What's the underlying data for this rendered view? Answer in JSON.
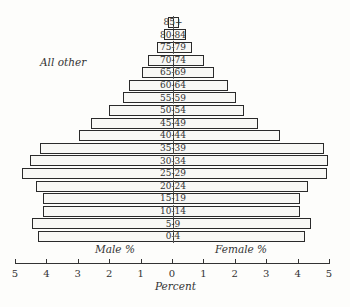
{
  "chart_data": {
    "type": "bar",
    "subtype": "population-pyramid",
    "title": "",
    "annotation": "All other",
    "xlabel": "Percent",
    "left_label": "Male %",
    "right_label": "Female %",
    "xlim": [
      -5,
      5
    ],
    "x_ticks": [
      "5",
      "4",
      "3",
      "2",
      "1",
      "0",
      "1",
      "2",
      "3",
      "4",
      "5"
    ],
    "grid": false,
    "categories": [
      "85+",
      "80-84",
      "75-79",
      "70-74",
      "65-69",
      "60-64",
      "55-59",
      "50-54",
      "45-49",
      "40-44",
      "35-39",
      "30-34",
      "25-29",
      "20-24",
      "15-19",
      "10-14",
      "5-9",
      "0-4"
    ],
    "series": [
      {
        "name": "Male %",
        "values": [
          0.15,
          0.3,
          0.5,
          0.8,
          1.0,
          1.4,
          1.6,
          2.05,
          2.6,
          3.0,
          4.25,
          4.55,
          4.8,
          4.35,
          4.15,
          4.15,
          4.5,
          4.3
        ]
      },
      {
        "name": "Female %",
        "values": [
          0.2,
          0.4,
          0.6,
          1.0,
          1.3,
          1.75,
          2.0,
          2.25,
          2.7,
          3.4,
          4.8,
          4.95,
          4.9,
          4.3,
          4.05,
          4.05,
          4.4,
          4.2
        ]
      }
    ]
  },
  "colors": {
    "bar_fill": "#f8f8f5",
    "bar_stroke": "#2a2a2a"
  }
}
